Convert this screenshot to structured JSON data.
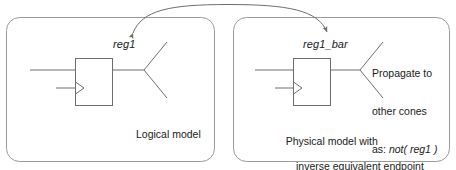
{
  "figure": {
    "title_hidden": "",
    "background_color": "#ffffff",
    "line_color": "#6e6e6e",
    "panel_border_color": "#9a9a9a",
    "text_color": "#1a1a1a"
  },
  "panels": [
    {
      "id": "logical",
      "signal_label": "reg1",
      "caption": "Logical model",
      "caption_line2": "",
      "register_symbol": "d-flip-flop",
      "clock_symbol": "clock-triangle",
      "fanout_symbol": "fanout-cone"
    },
    {
      "id": "physical",
      "signal_label": "reg1_bar",
      "caption": "Physical model with",
      "caption_line2": "inverse equivalent endpoint",
      "register_symbol": "d-flip-flop",
      "clock_symbol": "clock-triangle",
      "fanout_symbol": "fanout-cone"
    }
  ],
  "annotation": {
    "line1": "Propagate to",
    "line2": "other cones",
    "line3_prefix": "as: ",
    "line3_expression": "not( reg1 )"
  },
  "connector": {
    "type": "double-headed-arc",
    "description": "arc linking reg1 in logical model to reg1_bar in physical model"
  }
}
